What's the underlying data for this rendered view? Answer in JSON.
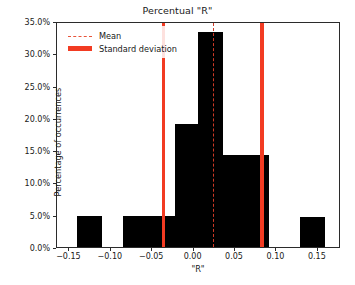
{
  "chart_data": {
    "type": "bar",
    "title": "Percentual \"R\"",
    "xlabel": "\"R\"",
    "ylabel": "Percentage of occurrences",
    "xlim": [
      -0.165,
      0.178
    ],
    "ylim": [
      0,
      35
    ],
    "grid": false,
    "legend_position": "upper left",
    "xticks": [
      -0.15,
      -0.1,
      -0.05,
      0.0,
      0.05,
      0.1,
      0.15
    ],
    "xtick_labels": [
      "−0.15",
      "−0.10",
      "−0.05",
      "0.00",
      "0.05",
      "0.10",
      "0.15"
    ],
    "yticks": [
      0,
      5,
      10,
      15,
      20,
      25,
      30,
      35
    ],
    "ytick_labels": [
      "0.0%",
      "5.0%",
      "10.0%",
      "15.0%",
      "20.0%",
      "25.0%",
      "30.0%",
      "35.0%"
    ],
    "bar_color": "#000000",
    "bins": [
      {
        "left": -0.1405,
        "right": -0.1105,
        "value": 4.8
      },
      {
        "left": -0.0855,
        "right": -0.0225,
        "value": 4.8
      },
      {
        "left": -0.0225,
        "right": 0.0055,
        "value": 19.0
      },
      {
        "left": 0.0055,
        "right": 0.0355,
        "value": 33.3
      },
      {
        "left": 0.0355,
        "right": 0.0905,
        "value": 14.2
      },
      {
        "left": 0.1285,
        "right": 0.1585,
        "value": 4.7
      }
    ],
    "annotations": {
      "mean": {
        "label": "Mean",
        "x": 0.0238,
        "style": "dashed",
        "color": "#cf3a26"
      },
      "std_deviation": {
        "label": "Standard deviation",
        "x": [
          -0.0362,
          0.0828
        ],
        "style": "solid",
        "color": "#f23b22"
      }
    }
  }
}
